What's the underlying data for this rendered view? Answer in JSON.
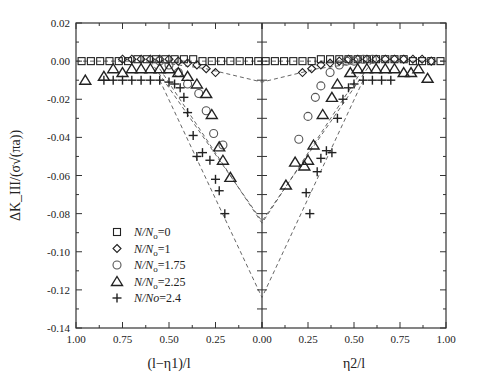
{
  "chart_data": {
    "type": "scatter",
    "title": "",
    "ylabel": "ΔK_III/(σ√(πa))",
    "xlabel_left": "(l−η1)/l",
    "xlabel_right": "η2/l",
    "ylim": [
      -0.14,
      0.02
    ],
    "yticks": [
      "0.02",
      "0.00",
      "-0.02",
      "-0.04",
      "-0.06",
      "-0.08",
      "-0.10",
      "-0.12",
      "-0.14"
    ],
    "xticks": [
      "1.00",
      "0.75",
      "0.50",
      "0.25",
      "0.00",
      "0.25",
      "0.50",
      "0.75",
      "1.00"
    ],
    "grid": false,
    "legend_position": "lower-left inside",
    "legend": [
      {
        "marker": "square",
        "label_italic": "N/N",
        "sub": "o",
        "suffix": "=0"
      },
      {
        "marker": "diamond",
        "label_italic": "N/N",
        "sub": "o",
        "suffix": "=1"
      },
      {
        "marker": "circle",
        "label_italic": "N/N",
        "sub": "o",
        "suffix": "=1.75"
      },
      {
        "marker": "triangle",
        "label_italic": "N/N",
        "sub": "o",
        "suffix": "=2.25"
      },
      {
        "marker": "plus",
        "label_italic": "N/No",
        "sub": "",
        "suffix": "=2.4"
      }
    ],
    "series": [
      {
        "name": "N/No=0",
        "marker": "square",
        "left": {
          "x": [
            0.97,
            0.92,
            0.87,
            0.82,
            0.77,
            0.72,
            0.67,
            0.62,
            0.57,
            0.52,
            0.47,
            0.42,
            0.37,
            0.32,
            0.27,
            0.22,
            0.17,
            0.12,
            0.07,
            0.02
          ],
          "y": [
            0.0,
            0.0,
            0.0,
            0.0,
            0.0,
            0.0,
            0.001,
            0.001,
            0.001,
            0.001,
            0.001,
            0.001,
            0.001,
            0.0,
            0.0,
            0.0,
            0.0,
            0.0,
            0.0,
            0.0
          ]
        },
        "right": {
          "x": [
            0.02,
            0.07,
            0.12,
            0.17,
            0.22,
            0.27,
            0.32,
            0.37,
            0.42,
            0.47,
            0.52,
            0.57,
            0.62,
            0.67,
            0.72,
            0.77,
            0.82,
            0.87,
            0.92,
            0.97
          ],
          "y": [
            0.0,
            0.0,
            0.0,
            0.0,
            0.0,
            0.0,
            0.001,
            0.001,
            0.001,
            0.001,
            0.001,
            0.001,
            0.001,
            0.001,
            0.001,
            0.001,
            0.0,
            0.0,
            0.0,
            0.0
          ]
        },
        "curve": {
          "x": [
            1.0,
            0.0,
            1.0
          ],
          "y": [
            0.0,
            0.0,
            0.0
          ]
        }
      },
      {
        "name": "N/No=1",
        "marker": "diamond",
        "left": {
          "x": [
            0.75,
            0.7,
            0.65,
            0.6,
            0.55,
            0.5,
            0.45,
            0.4,
            0.35,
            0.3,
            0.25
          ],
          "y": [
            0.001,
            0.001,
            0.001,
            0.001,
            0.001,
            0.001,
            0.0,
            -0.001,
            -0.002,
            -0.004,
            -0.006
          ]
        },
        "right": {
          "x": [
            0.22,
            0.27,
            0.32,
            0.37,
            0.42,
            0.47,
            0.52,
            0.57,
            0.62,
            0.67,
            0.72,
            0.77,
            0.82,
            0.87,
            0.92
          ],
          "y": [
            -0.006,
            -0.004,
            -0.002,
            -0.001,
            0.0,
            0.001,
            0.001,
            0.001,
            0.001,
            0.001,
            0.001,
            0.001,
            0.001,
            0.001,
            0.0
          ]
        },
        "curve": {
          "x_left": [
            0.6,
            0.3,
            0.0
          ],
          "y_left": [
            0.0,
            -0.004,
            -0.011
          ],
          "x_right": [
            0.0,
            0.3,
            0.6
          ],
          "y_right": [
            -0.011,
            -0.004,
            0.0
          ]
        }
      },
      {
        "name": "N/No=1.75",
        "marker": "circle",
        "left": {
          "x": [
            0.55,
            0.5,
            0.45,
            0.4,
            0.34,
            0.3,
            0.26,
            0.21
          ],
          "y": [
            0.0,
            -0.002,
            -0.006,
            -0.012,
            -0.017,
            -0.026,
            -0.038,
            -0.044
          ]
        },
        "right": {
          "x": [
            0.2,
            0.25,
            0.29,
            0.32,
            0.37,
            0.42,
            0.46,
            0.5,
            0.55,
            0.6
          ],
          "y": [
            -0.041,
            -0.029,
            -0.019,
            -0.013,
            -0.006,
            -0.002,
            0.0,
            0.0,
            0.001,
            0.001
          ]
        },
        "curve": {
          "x_left": [
            0.6,
            0.0
          ],
          "y_left": [
            0.0,
            -0.084
          ],
          "x_right": [
            0.0,
            0.6
          ],
          "y_right": [
            -0.084,
            0.0
          ]
        }
      },
      {
        "name": "N/No=2.25",
        "marker": "triangle",
        "left": {
          "x": [
            0.95,
            0.85,
            0.8,
            0.75,
            0.7,
            0.65,
            0.6,
            0.55,
            0.5,
            0.45,
            0.4,
            0.35,
            0.3,
            0.27,
            0.23,
            0.21,
            0.17
          ],
          "y": [
            -0.01,
            -0.008,
            -0.004,
            -0.006,
            -0.004,
            -0.004,
            -0.004,
            -0.004,
            -0.004,
            -0.006,
            -0.008,
            -0.012,
            -0.017,
            -0.028,
            -0.045,
            -0.052,
            -0.061
          ]
        },
        "right": {
          "x": [
            0.13,
            0.18,
            0.23,
            0.25,
            0.28,
            0.33,
            0.38,
            0.41,
            0.48,
            0.52,
            0.57,
            0.62,
            0.67,
            0.72,
            0.77,
            0.81,
            0.85,
            0.9
          ],
          "y": [
            -0.065,
            -0.053,
            -0.055,
            -0.052,
            -0.044,
            -0.028,
            -0.019,
            -0.012,
            -0.006,
            -0.004,
            -0.004,
            -0.004,
            -0.004,
            -0.004,
            -0.006,
            -0.006,
            -0.004,
            -0.009
          ]
        },
        "curve": {
          "x_left": [
            0.55,
            0.0
          ],
          "y_left": [
            -0.004,
            -0.085
          ],
          "x_right": [
            0.0,
            0.55
          ],
          "y_right": [
            -0.085,
            -0.004
          ]
        }
      },
      {
        "name": "N/No=2.4",
        "marker": "plus",
        "left": {
          "x": [
            0.85,
            0.8,
            0.75,
            0.7,
            0.65,
            0.6,
            0.55,
            0.5,
            0.47,
            0.44,
            0.42,
            0.4,
            0.37,
            0.35,
            0.32,
            0.28,
            0.25,
            0.23,
            0.2
          ],
          "y": [
            -0.01,
            -0.01,
            -0.01,
            -0.01,
            -0.01,
            -0.01,
            -0.01,
            -0.011,
            -0.012,
            -0.014,
            -0.019,
            -0.027,
            -0.039,
            -0.05,
            -0.048,
            -0.052,
            -0.062,
            -0.068,
            -0.08
          ]
        },
        "right": {
          "x": [
            0.24,
            0.26,
            0.3,
            0.32,
            0.35,
            0.38,
            0.41,
            0.44,
            0.47,
            0.5,
            0.55,
            0.6,
            0.65,
            0.7
          ],
          "y": [
            -0.069,
            -0.08,
            -0.058,
            -0.051,
            -0.047,
            -0.048,
            -0.03,
            -0.02,
            -0.014,
            -0.012,
            -0.01,
            -0.01,
            -0.01,
            -0.01
          ]
        },
        "curve": {
          "x_left": [
            0.55,
            0.0
          ],
          "y_left": [
            -0.01,
            -0.124
          ],
          "x_right": [
            0.0,
            0.55
          ],
          "y_right": [
            -0.124,
            -0.01
          ]
        }
      }
    ]
  }
}
